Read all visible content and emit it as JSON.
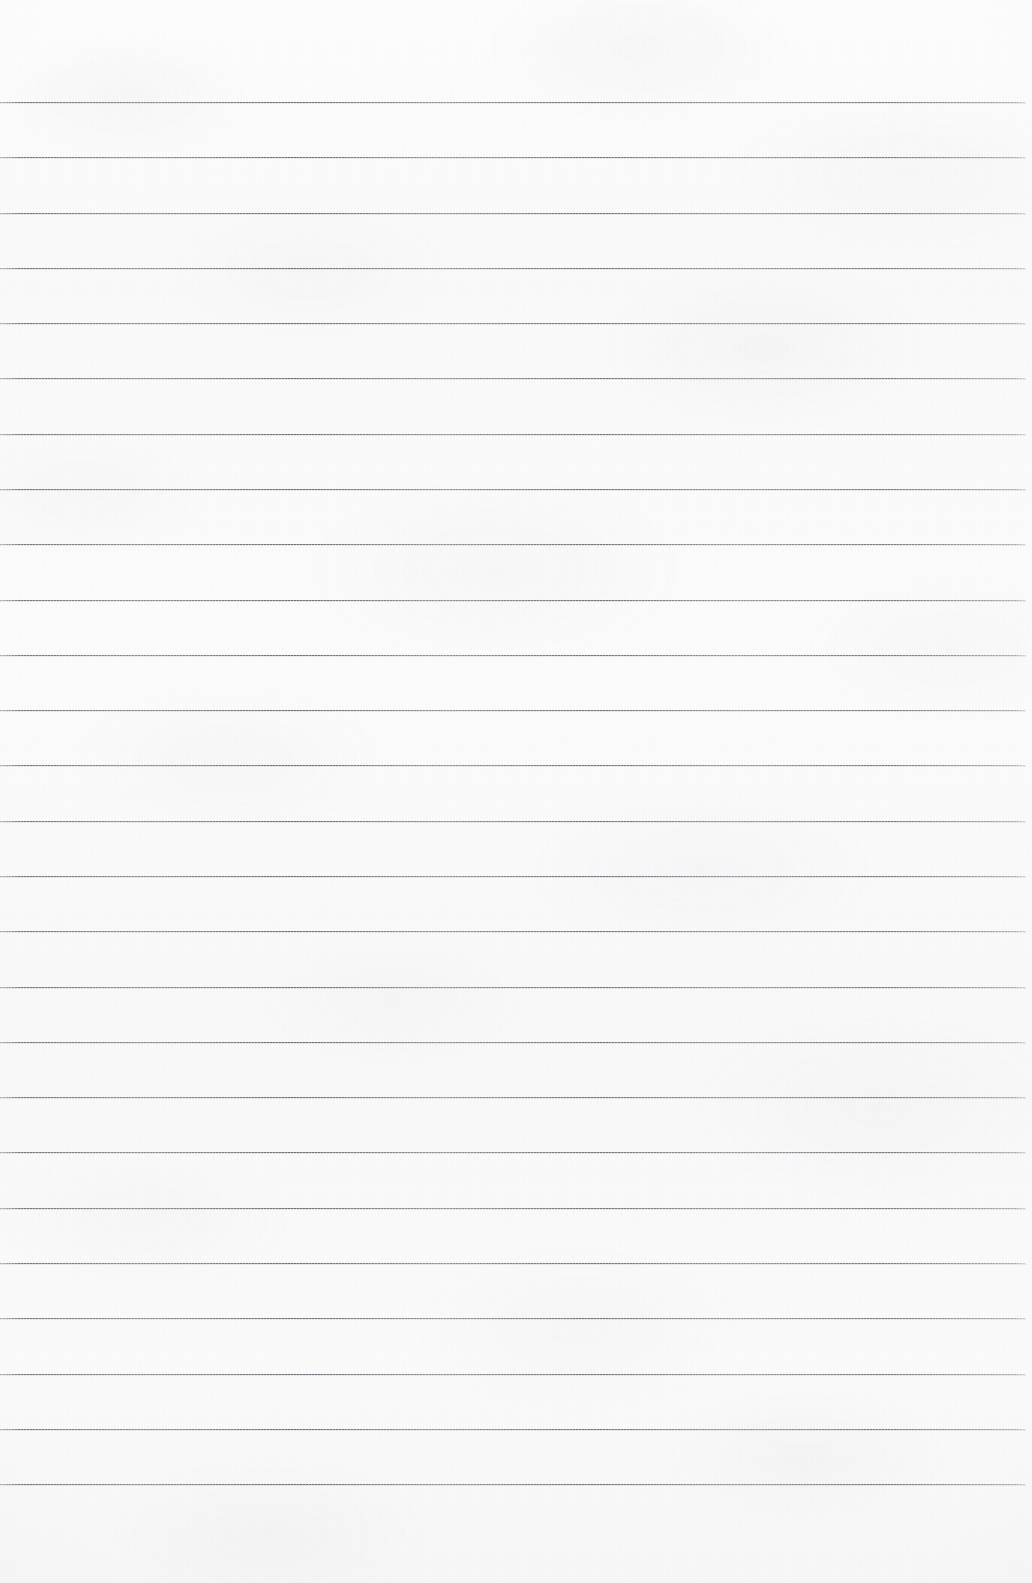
{
  "document": {
    "type": "ruled-notebook-paper",
    "title": "Blank Lined Paper",
    "orientation": "portrait",
    "width_px": 1032,
    "height_px": 1583,
    "has_text_content": false,
    "has_margin_rule": false,
    "content_text": ""
  },
  "paper": {
    "background_color": "#fbfbfb",
    "base_tint_color": "#fdfdfd",
    "texture": "mottled-fiber",
    "vignette_color": "#787a80",
    "edge_shading": "subtle"
  },
  "ruling": {
    "line_color": "#686b73",
    "line_color_light": "#7c7f86",
    "line_thickness_px": 1,
    "first_line_y_px": 102,
    "line_spacing_px": 55.3,
    "line_count": 26,
    "line_start_x_px": 0,
    "line_end_x_px": 1026,
    "style": "horizontal-rule-only",
    "lines": [
      {
        "index": 1,
        "y": 102
      },
      {
        "index": 2,
        "y": 157
      },
      {
        "index": 3,
        "y": 213
      },
      {
        "index": 4,
        "y": 268
      },
      {
        "index": 5,
        "y": 323
      },
      {
        "index": 6,
        "y": 378
      },
      {
        "index": 7,
        "y": 434
      },
      {
        "index": 8,
        "y": 489
      },
      {
        "index": 9,
        "y": 544
      },
      {
        "index": 10,
        "y": 600
      },
      {
        "index": 11,
        "y": 655
      },
      {
        "index": 12,
        "y": 710
      },
      {
        "index": 13,
        "y": 765
      },
      {
        "index": 14,
        "y": 821
      },
      {
        "index": 15,
        "y": 876
      },
      {
        "index": 16,
        "y": 931
      },
      {
        "index": 17,
        "y": 987
      },
      {
        "index": 18,
        "y": 1042
      },
      {
        "index": 19,
        "y": 1097
      },
      {
        "index": 20,
        "y": 1152
      },
      {
        "index": 21,
        "y": 1208
      },
      {
        "index": 22,
        "y": 1263
      },
      {
        "index": 23,
        "y": 1318
      },
      {
        "index": 24,
        "y": 1374
      },
      {
        "index": 25,
        "y": 1429
      },
      {
        "index": 26,
        "y": 1484
      }
    ]
  }
}
